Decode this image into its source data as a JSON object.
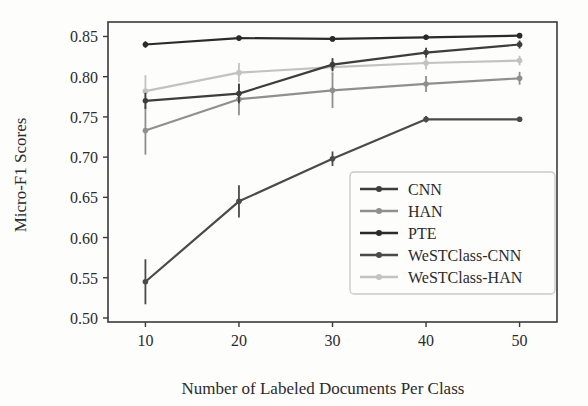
{
  "chart_data": {
    "type": "line",
    "title": "",
    "xlabel": "Number of Labeled Documents Per Class",
    "ylabel": "Micro-F1 Scores",
    "x": [
      10,
      20,
      30,
      40,
      50
    ],
    "xtick_labels": [
      "10",
      "20",
      "30",
      "40",
      "50"
    ],
    "ytick_labels": [
      "0.50",
      "0.55",
      "0.60",
      "0.65",
      "0.70",
      "0.75",
      "0.80",
      "0.85"
    ],
    "ytick_values": [
      0.5,
      0.55,
      0.6,
      0.65,
      0.7,
      0.75,
      0.8,
      0.85
    ],
    "xlim": [
      6,
      54
    ],
    "ylim": [
      0.495,
      0.868
    ],
    "grid": false,
    "legend_position": "lower right",
    "error_bars": true,
    "series": [
      {
        "name": "CNN",
        "color": "#3d3d3d",
        "values": [
          0.77,
          0.779,
          0.815,
          0.83,
          0.84
        ],
        "errors": [
          0.01,
          0.012,
          0.008,
          0.006,
          0.005
        ]
      },
      {
        "name": "HAN",
        "color": "#8f8f8f",
        "values": [
          0.733,
          0.772,
          0.783,
          0.791,
          0.798
        ],
        "errors": [
          0.03,
          0.02,
          0.022,
          0.01,
          0.008
        ]
      },
      {
        "name": "PTE",
        "color": "#2a2a2a",
        "values": [
          0.84,
          0.848,
          0.847,
          0.849,
          0.851
        ],
        "errors": [
          0.004,
          0.003,
          0.003,
          0.003,
          0.003
        ]
      },
      {
        "name": "WeSTClass-CNN",
        "color": "#4a4a4a",
        "values": [
          0.545,
          0.645,
          0.698,
          0.747,
          0.747
        ],
        "errors": [
          0.028,
          0.02,
          0.009,
          0.004,
          0.003
        ]
      },
      {
        "name": "WeSTClass-HAN",
        "color": "#c2c2c2",
        "values": [
          0.782,
          0.805,
          0.812,
          0.817,
          0.82
        ],
        "errors": [
          0.02,
          0.012,
          0.01,
          0.008,
          0.006
        ]
      }
    ]
  },
  "axes": {
    "frame_color": "#3a3a3a",
    "background": "#fdfdfc"
  }
}
